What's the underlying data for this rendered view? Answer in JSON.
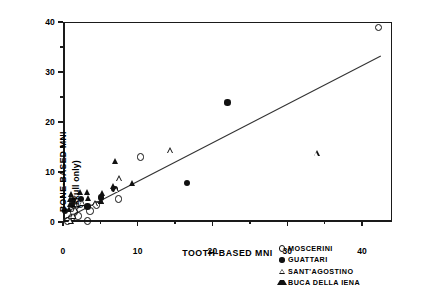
{
  "chart_data": {
    "type": "scatter",
    "title": "",
    "xlabel": "TOOTH-BASED MNI",
    "ylabel_line1": "BONE-BASED MNI",
    "ylabel_line2": "(skull only)",
    "xlim": [
      0,
      44
    ],
    "ylim": [
      0,
      40
    ],
    "xticks": [
      0,
      10,
      20,
      30,
      40
    ],
    "yticks": [
      0,
      10,
      20,
      30,
      40
    ],
    "xticklabels": [
      "0",
      "10",
      "20",
      "30",
      "40"
    ],
    "yticklabels": [
      "0",
      "10",
      "20",
      "30",
      "40"
    ],
    "x_minor_ticks": [
      5,
      15,
      25,
      35
    ],
    "y_minor_ticks": [
      5,
      15,
      25,
      35
    ],
    "grid": false,
    "legend_position": "lower right outside",
    "trendline": {
      "x0": 0,
      "y0": 0.4,
      "x1": 42.5,
      "y1": 33.2,
      "style": "solid"
    },
    "series": [
      {
        "name": "MOSCERINI",
        "marker": "open-circle",
        "points": [
          [
            0.6,
            0.2
          ],
          [
            1.2,
            0.9
          ],
          [
            1.5,
            2.0
          ],
          [
            1.7,
            3.2
          ],
          [
            2.0,
            1.2
          ],
          [
            2.3,
            3.6
          ],
          [
            3.3,
            0.2
          ],
          [
            3.6,
            2.2
          ],
          [
            4.5,
            3.4
          ],
          [
            7.4,
            4.6
          ],
          [
            10.4,
            13.0
          ],
          [
            42.2,
            38.9
          ]
        ]
      },
      {
        "name": "GUATTARI",
        "marker": "filled-circle",
        "points": [
          [
            0.3,
            2.2
          ],
          [
            1.2,
            3.4
          ],
          [
            1.3,
            4.4
          ],
          [
            2.4,
            4.6
          ],
          [
            3.3,
            3.1
          ],
          [
            5.1,
            4.9
          ],
          [
            6.9,
            6.6
          ],
          [
            16.6,
            7.8
          ],
          [
            22.0,
            23.9
          ]
        ]
      },
      {
        "name": "SANT'AGOSTINO",
        "marker": "open-triangle",
        "points": [
          [
            1.1,
            0.3
          ],
          [
            1.4,
            1.3
          ],
          [
            1.7,
            2.6
          ],
          [
            2.6,
            3.9
          ],
          [
            4.4,
            3.8
          ],
          [
            5.2,
            4.2
          ],
          [
            7.2,
            6.6
          ],
          [
            7.6,
            8.8
          ],
          [
            14.4,
            14.4
          ],
          [
            34.0,
            13.8
          ]
        ]
      },
      {
        "name": "BUCA DELLA IENA",
        "marker": "filled-triangle",
        "points": [
          [
            0.9,
            2.6
          ],
          [
            1.0,
            3.6
          ],
          [
            1.1,
            4.6
          ],
          [
            1.2,
            5.6
          ],
          [
            2.4,
            5.9
          ],
          [
            3.3,
            5.9
          ],
          [
            3.5,
            4.8
          ],
          [
            5.2,
            4.2
          ],
          [
            5.3,
            5.7
          ],
          [
            6.8,
            7.1
          ],
          [
            7.1,
            12.2
          ],
          [
            9.4,
            7.7
          ]
        ]
      }
    ]
  },
  "legend": {
    "items": [
      {
        "label": "MOSCERINI",
        "marker": "open-circle"
      },
      {
        "label": "GUATTARI",
        "marker": "filled-circle"
      },
      {
        "label": "SANT'AGOSTINO",
        "marker": "open-triangle"
      },
      {
        "label": "BUCA DELLA IENA",
        "marker": "filled-triangle"
      }
    ]
  }
}
